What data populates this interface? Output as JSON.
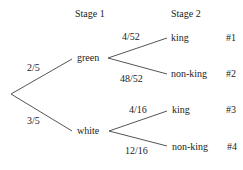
{
  "diagram": {
    "type": "probability-tree",
    "headers": {
      "stage1": "Stage 1",
      "stage2": "Stage 2"
    },
    "stage1": [
      {
        "label": "green",
        "prob": "2/5"
      },
      {
        "label": "white",
        "prob": "3/5"
      }
    ],
    "stage2": [
      {
        "label": "king",
        "prob": "4/52",
        "outcome": "#1"
      },
      {
        "label": "non-king",
        "prob": "48/52",
        "outcome": "#2"
      },
      {
        "label": "king",
        "prob": "4/16",
        "outcome": "#3"
      },
      {
        "label": "non-king",
        "prob": "12/16",
        "outcome": "#4"
      }
    ],
    "line_color": "#555555"
  }
}
